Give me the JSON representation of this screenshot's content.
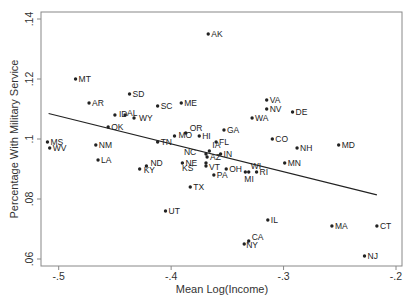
{
  "chart_data": {
    "type": "scatter",
    "title": "",
    "xlabel": "Mean Log(Income)",
    "ylabel": "Percentage With Military Service",
    "xlim": [
      -0.515,
      -0.195
    ],
    "ylim": [
      0.0553,
      0.1453
    ],
    "x_ticks": [
      -0.5,
      -0.4,
      -0.3,
      -0.2
    ],
    "x_tick_labels": [
      "-.5",
      "-.4",
      "-.3",
      "-.2"
    ],
    "y_ticks": [
      0.06,
      0.08,
      0.1,
      0.12,
      0.14
    ],
    "y_tick_labels": [
      ".06",
      ".08",
      ".1",
      ".12",
      ".14"
    ],
    "grid": false,
    "legend": null,
    "points": [
      {
        "label": "AK",
        "x": -0.367,
        "y": 0.135
      },
      {
        "label": "MT",
        "x": -0.485,
        "y": 0.12
      },
      {
        "label": "SD",
        "x": -0.437,
        "y": 0.115
      },
      {
        "label": "AR",
        "x": -0.473,
        "y": 0.112
      },
      {
        "label": "ME",
        "x": -0.391,
        "y": 0.112
      },
      {
        "label": "SC",
        "x": -0.412,
        "y": 0.111
      },
      {
        "label": "ID",
        "x": -0.45,
        "y": 0.108
      },
      {
        "label": "AL",
        "x": -0.441,
        "y": 0.108
      },
      {
        "label": "WY",
        "x": -0.433,
        "y": 0.107
      },
      {
        "label": "OK",
        "x": -0.456,
        "y": 0.104
      },
      {
        "label": "VA",
        "x": -0.315,
        "y": 0.113
      },
      {
        "label": "NV",
        "x": -0.315,
        "y": 0.11
      },
      {
        "label": "DE",
        "x": -0.292,
        "y": 0.109
      },
      {
        "label": "WA",
        "x": -0.328,
        "y": 0.107
      },
      {
        "label": "GA",
        "x": -0.353,
        "y": 0.103
      },
      {
        "label": "OR",
        "x": -0.387,
        "y": 0.102
      },
      {
        "label": "MO",
        "x": -0.397,
        "y": 0.101
      },
      {
        "label": "HI",
        "x": -0.375,
        "y": 0.101
      },
      {
        "label": "MS",
        "x": -0.51,
        "y": 0.099
      },
      {
        "label": "WV",
        "x": -0.508,
        "y": 0.097
      },
      {
        "label": "NM",
        "x": -0.467,
        "y": 0.098
      },
      {
        "label": "TN",
        "x": -0.412,
        "y": 0.099
      },
      {
        "label": "FL",
        "x": -0.36,
        "y": 0.099
      },
      {
        "label": "CO",
        "x": -0.31,
        "y": 0.1
      },
      {
        "label": "NH",
        "x": -0.288,
        "y": 0.097
      },
      {
        "label": "MD",
        "x": -0.251,
        "y": 0.098
      },
      {
        "label": "NC",
        "x": -0.369,
        "y": 0.095
      },
      {
        "label": "IA",
        "x": -0.366,
        "y": 0.096
      },
      {
        "label": "IN",
        "x": -0.356,
        "y": 0.095
      },
      {
        "label": "AZ",
        "x": -0.368,
        "y": 0.094
      },
      {
        "label": "LA",
        "x": -0.465,
        "y": 0.093
      },
      {
        "label": "ND",
        "x": -0.422,
        "y": 0.091
      },
      {
        "label": "NE",
        "x": -0.39,
        "y": 0.092
      },
      {
        "label": "MN",
        "x": -0.299,
        "y": 0.092
      },
      {
        "label": "KS",
        "x": -0.369,
        "y": 0.092
      },
      {
        "label": "VT",
        "x": -0.369,
        "y": 0.091
      },
      {
        "label": "OH",
        "x": -0.351,
        "y": 0.09
      },
      {
        "label": "KY",
        "x": -0.428,
        "y": 0.09
      },
      {
        "label": "WI",
        "x": -0.331,
        "y": 0.089
      },
      {
        "label": "MI",
        "x": -0.334,
        "y": 0.089
      },
      {
        "label": "RI",
        "x": -0.324,
        "y": 0.089
      },
      {
        "label": "PA",
        "x": -0.362,
        "y": 0.088
      },
      {
        "label": "TX",
        "x": -0.383,
        "y": 0.084
      },
      {
        "label": "UT",
        "x": -0.405,
        "y": 0.076
      },
      {
        "label": "IL",
        "x": -0.314,
        "y": 0.073
      },
      {
        "label": "MA",
        "x": -0.257,
        "y": 0.071
      },
      {
        "label": "CT",
        "x": -0.217,
        "y": 0.071
      },
      {
        "label": "CA",
        "x": -0.331,
        "y": 0.066
      },
      {
        "label": "NY",
        "x": -0.335,
        "y": 0.065
      },
      {
        "label": "NJ",
        "x": -0.228,
        "y": 0.061
      }
    ],
    "label_offsets": {
      "KS": [
        -24,
        8
      ],
      "NC": [
        -22,
        1
      ],
      "VT": [
        3,
        4
      ],
      "AZ": [
        3,
        3
      ],
      "IA": [
        3,
        -3
      ],
      "MI": [
        -1,
        10
      ],
      "WI": [
        2,
        -3
      ],
      "NY": [
        2,
        4
      ],
      "CA": [
        3,
        -1
      ],
      "ID": [
        4,
        2
      ],
      "AL": [
        2,
        1
      ],
      "WY": [
        5,
        3
      ],
      "MO": [
        4,
        2
      ],
      "OR": [
        4,
        -2
      ],
      "KY": [
        4,
        4
      ],
      "ND": [
        4,
        0
      ]
    },
    "fit_line": {
      "x1": -0.509,
      "y1": 0.1085,
      "x2": -0.217,
      "y2": 0.0814
    },
    "colors": {
      "point": "#222222",
      "line": "#222222",
      "frame": "#888888",
      "text": "#333333"
    }
  }
}
